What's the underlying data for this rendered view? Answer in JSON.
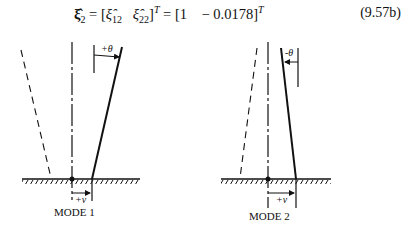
{
  "equation": {
    "lhs": "ξ̂₂",
    "middle": "[ξ̂₁₂   ξ̂₂₂]ᵀ",
    "rhs": "[1    − 0.0178]ᵀ",
    "number": "(9.57b)"
  },
  "figures": [
    {
      "caption": "MODE 1",
      "theta_label": "+θ",
      "displacement_label": "+ν"
    },
    {
      "caption": "MODE 2",
      "theta_label": "-θ",
      "displacement_label": "+ν"
    }
  ]
}
